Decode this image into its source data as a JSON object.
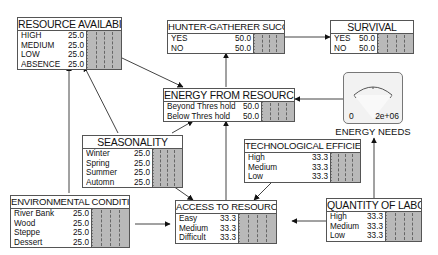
{
  "nodes": {
    "resource_availability": {
      "title": "RESOURCE AVAILABILITY",
      "states": [
        {
          "label": "HIGH",
          "value": "25.0"
        },
        {
          "label": "MEDIUM",
          "value": "25.0"
        },
        {
          "label": "LOW",
          "value": "25.0"
        },
        {
          "label": "ABSENCE",
          "value": "25.0"
        }
      ]
    },
    "hunter_gatherer_success": {
      "title": "HUNTER-GATHERER SUCCESS",
      "states": [
        {
          "label": "YES",
          "value": "50.0"
        },
        {
          "label": "NO",
          "value": "50.0"
        }
      ]
    },
    "survival": {
      "title": "SURVIVAL",
      "states": [
        {
          "label": "YES",
          "value": "50.0"
        },
        {
          "label": "NO",
          "value": "50.0"
        }
      ]
    },
    "energy_from_resources": {
      "title": "ENERGY FROM RESOURCES",
      "states": [
        {
          "label": "Beyond Thres hold",
          "value": "50.0"
        },
        {
          "label": "Below Thres hold",
          "value": "50.0"
        }
      ]
    },
    "seasonality": {
      "title": "SEASONALITY",
      "states": [
        {
          "label": "Winter",
          "value": "25.0"
        },
        {
          "label": "Spring",
          "value": "25.0"
        },
        {
          "label": "Summer",
          "value": "25.0"
        },
        {
          "label": "Automn",
          "value": "25.0"
        }
      ]
    },
    "technological_efficiency": {
      "title": "TECHNOLOGICAL EFFICIENCY",
      "states": [
        {
          "label": "High",
          "value": "33.3"
        },
        {
          "label": "Medium",
          "value": "33.3"
        },
        {
          "label": "Low",
          "value": "33.3"
        }
      ]
    },
    "environmental_conditions": {
      "title": "ENVIRONMENTAL CONDITIONS",
      "states": [
        {
          "label": "River Bank",
          "value": "25.0"
        },
        {
          "label": "Wood",
          "value": "25.0"
        },
        {
          "label": "Steppe",
          "value": "25.0"
        },
        {
          "label": "Dessert",
          "value": "25.0"
        }
      ]
    },
    "access_to_resources": {
      "title": "ACCESS TO RESOURCES",
      "states": [
        {
          "label": "Easy",
          "value": "33.3"
        },
        {
          "label": "Medium",
          "value": "33.3"
        },
        {
          "label": "Difficult",
          "value": "33.3"
        }
      ]
    },
    "quantity_of_labor": {
      "title": "QUANTITY OF LABOR",
      "states": [
        {
          "label": "High",
          "value": "33.3"
        },
        {
          "label": "Medium",
          "value": "33.3"
        },
        {
          "label": "Low",
          "value": "33.3"
        }
      ]
    }
  },
  "energy_needs": {
    "label": "ENERGY NEEDS",
    "min_label": "0",
    "max_label": "2e+06"
  },
  "links": [
    {
      "from": "seasonality",
      "to": "resource_availability"
    },
    {
      "from": "environmental_conditions",
      "to": "resource_availability"
    },
    {
      "from": "resource_availability",
      "to": "energy_from_resources"
    },
    {
      "from": "seasonality",
      "to": "energy_from_resources"
    },
    {
      "from": "access_to_resources",
      "to": "energy_from_resources"
    },
    {
      "from": "energy_from_resources",
      "to": "hunter_gatherer_success"
    },
    {
      "from": "hunter_gatherer_success",
      "to": "survival"
    },
    {
      "from": "energy_needs",
      "to": "energy_from_resources"
    },
    {
      "from": "quantity_of_labor",
      "to": "energy_needs"
    },
    {
      "from": "seasonality",
      "to": "access_to_resources"
    },
    {
      "from": "technological_efficiency",
      "to": "access_to_resources"
    },
    {
      "from": "environmental_conditions",
      "to": "access_to_resources"
    },
    {
      "from": "quantity_of_labor",
      "to": "access_to_resources"
    }
  ]
}
